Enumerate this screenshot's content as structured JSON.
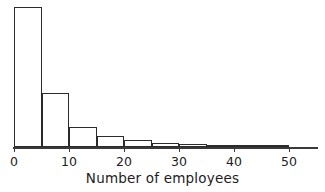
{
  "chart_data": {
    "type": "bar",
    "title": "",
    "subtitle": "",
    "xlabel": "Number of employees",
    "ylabel": "",
    "grid": false,
    "legend": null,
    "bin_width": 5,
    "xlim": [
      0,
      55
    ],
    "ylim": [
      0,
      140
    ],
    "x_ticks": [
      0,
      10,
      20,
      30,
      40,
      50
    ],
    "x_tick_labels": [
      "0",
      "10",
      "20",
      "30",
      "40",
      "50"
    ],
    "y_ticks": [],
    "y_tick_labels": [],
    "bin_edges": [
      0,
      5,
      10,
      15,
      20,
      25,
      30,
      35,
      40,
      45,
      50
    ],
    "categories": [
      "0-5",
      "5-10",
      "10-15",
      "15-20",
      "20-25",
      "25-30",
      "30-35",
      "35-40",
      "40-45",
      "45-50"
    ],
    "values": [
      140,
      54,
      20,
      11,
      7,
      4,
      3.5,
      2.5,
      2,
      1.5
    ],
    "bar_color": "#ffffff",
    "bar_edge_color": "#2b2b2b",
    "axis_color": "#3a3a3a",
    "text_color": "#1c1c1c",
    "background_color": "#ffffff",
    "annotations": []
  },
  "layout": {
    "baseline_y": 147,
    "x_origin_px": 14,
    "px_per_unit": 5.5,
    "axis_right_px": 318,
    "value_px_per_unit": 1.0,
    "tick_length": 5,
    "label_top": 170
  },
  "axis": {
    "x_label_text": "Number of employees"
  }
}
